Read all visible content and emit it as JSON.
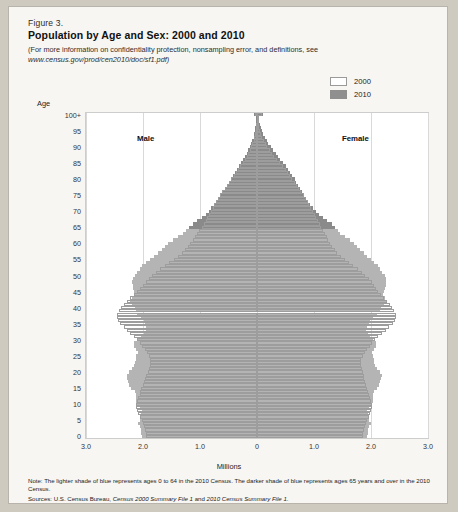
{
  "figure": {
    "number": "Figure 3.",
    "title": "Population by Age and Sex: 2000 and 2010",
    "subtitle": "(For more information on confidentiality protection, nonsampling error, and definitions, see",
    "url": "www.census.gov/prod/cen2010/doc/sf1.pdf)"
  },
  "legend": {
    "position": "top-right",
    "items": [
      {
        "label": "2000",
        "color": "#ffffff",
        "swatch": "outline"
      },
      {
        "label": "2010",
        "color": "#8f8f8f",
        "swatch": "filled"
      }
    ]
  },
  "labels": {
    "male": "Male",
    "female": "Female",
    "age_axis": "Age",
    "millions_axis": "Millions"
  },
  "footer": {
    "note": "Note: The lighter shade of blue represents ages 0 to 64 in the 2010 Census. The darker shade of blue represents ages 65 years and over in the 2010 Census.",
    "sources_prefix": "Sources: U.S. Census Bureau, ",
    "sources_italic": "Census 2000 Summary File 1",
    "sources_mid": " and ",
    "sources_italic2": "2010 Census Summary File 1",
    "sources_end": "."
  },
  "colors": {
    "bar_under65": "#b4b4b4",
    "bar_65plus": "#8a8a8a",
    "outline_2000": "#9d9d9d",
    "plot_bg": "#ffffff",
    "page_bg": "#f7f6f3",
    "gridline": "#d9d9d9"
  },
  "chart_data": {
    "type": "bar",
    "subtype": "population-pyramid",
    "title": "Population by Age and Sex: 2000 and 2010",
    "xlabel": "Millions",
    "ylabel": "Age",
    "xlim": [
      -3.0,
      3.0
    ],
    "xticks": [
      -3.0,
      -2.0,
      -1.0,
      0,
      1.0,
      2.0,
      3.0
    ],
    "xticklabels": [
      "3.0",
      "2.0",
      "1.0",
      "0",
      "1.0",
      "2.0",
      "3.0"
    ],
    "ylim": [
      0,
      100
    ],
    "yticks": [
      0,
      5,
      10,
      15,
      20,
      25,
      30,
      35,
      40,
      45,
      50,
      55,
      60,
      65,
      70,
      75,
      80,
      85,
      90,
      95,
      100
    ],
    "yticklabels": [
      "0",
      "5",
      "10",
      "15",
      "20",
      "25",
      "30",
      "35",
      "40",
      "45",
      "50",
      "55",
      "60",
      "65",
      "70",
      "75",
      "80",
      "85",
      "90",
      "95",
      "100+"
    ],
    "grid": "vertical",
    "legend_position": "top-right",
    "age_split_65": 65,
    "ages": [
      0,
      1,
      2,
      3,
      4,
      5,
      6,
      7,
      8,
      9,
      10,
      11,
      12,
      13,
      14,
      15,
      16,
      17,
      18,
      19,
      20,
      21,
      22,
      23,
      24,
      25,
      26,
      27,
      28,
      29,
      30,
      31,
      32,
      33,
      34,
      35,
      36,
      37,
      38,
      39,
      40,
      41,
      42,
      43,
      44,
      45,
      46,
      47,
      48,
      49,
      50,
      51,
      52,
      53,
      54,
      55,
      56,
      57,
      58,
      59,
      60,
      61,
      62,
      63,
      64,
      65,
      66,
      67,
      68,
      69,
      70,
      71,
      72,
      73,
      74,
      75,
      76,
      77,
      78,
      79,
      80,
      81,
      82,
      83,
      84,
      85,
      86,
      87,
      88,
      89,
      90,
      91,
      92,
      93,
      94,
      95,
      96,
      97,
      98,
      99,
      100
    ],
    "series": [
      {
        "name": "Male 2010",
        "side": "left",
        "year": 2010,
        "values": [
          2.02,
          2.03,
          2.04,
          2.06,
          2.09,
          2.06,
          2.04,
          2.03,
          2.02,
          2.05,
          2.1,
          2.12,
          2.12,
          2.12,
          2.14,
          2.21,
          2.24,
          2.26,
          2.28,
          2.28,
          2.25,
          2.19,
          2.16,
          2.14,
          2.13,
          2.12,
          2.09,
          2.12,
          2.16,
          2.15,
          2.1,
          2.03,
          1.98,
          1.95,
          1.95,
          1.97,
          1.98,
          2.03,
          2.1,
          2.13,
          2.14,
          2.2,
          2.23,
          2.2,
          2.16,
          2.16,
          2.17,
          2.18,
          2.19,
          2.18,
          2.14,
          2.1,
          2.06,
          2.01,
          1.95,
          1.88,
          1.81,
          1.74,
          1.67,
          1.62,
          1.56,
          1.48,
          1.38,
          1.29,
          1.24,
          1.19,
          1.13,
          1.05,
          0.97,
          0.9,
          0.85,
          0.8,
          0.75,
          0.71,
          0.67,
          0.63,
          0.59,
          0.55,
          0.52,
          0.49,
          0.46,
          0.42,
          0.38,
          0.35,
          0.31,
          0.28,
          0.24,
          0.21,
          0.18,
          0.15,
          0.12,
          0.1,
          0.08,
          0.06,
          0.05,
          0.04,
          0.03,
          0.02,
          0.015,
          0.01,
          0.05
        ]
      },
      {
        "name": "Female 2010",
        "side": "right",
        "year": 2010,
        "values": [
          1.93,
          1.94,
          1.95,
          1.97,
          2.0,
          1.97,
          1.95,
          1.94,
          1.93,
          1.96,
          2.01,
          2.03,
          2.03,
          2.03,
          2.05,
          2.11,
          2.14,
          2.16,
          2.18,
          2.19,
          2.16,
          2.1,
          2.07,
          2.05,
          2.05,
          2.04,
          2.02,
          2.05,
          2.09,
          2.08,
          2.04,
          1.98,
          1.94,
          1.92,
          1.93,
          1.96,
          1.98,
          2.03,
          2.11,
          2.15,
          2.17,
          2.23,
          2.27,
          2.24,
          2.21,
          2.22,
          2.24,
          2.26,
          2.27,
          2.27,
          2.24,
          2.2,
          2.16,
          2.12,
          2.06,
          2.0,
          1.93,
          1.87,
          1.81,
          1.76,
          1.71,
          1.64,
          1.55,
          1.46,
          1.42,
          1.37,
          1.31,
          1.23,
          1.15,
          1.08,
          1.03,
          0.98,
          0.93,
          0.89,
          0.86,
          0.82,
          0.79,
          0.75,
          0.72,
          0.69,
          0.66,
          0.62,
          0.58,
          0.54,
          0.5,
          0.46,
          0.41,
          0.37,
          0.33,
          0.28,
          0.24,
          0.2,
          0.17,
          0.14,
          0.11,
          0.09,
          0.07,
          0.05,
          0.035,
          0.025,
          0.11
        ]
      },
      {
        "name": "Male 2000",
        "side": "left",
        "year": 2000,
        "values": [
          1.95,
          1.95,
          1.96,
          1.98,
          2.0,
          2.02,
          2.05,
          2.08,
          2.1,
          2.12,
          2.12,
          2.1,
          2.08,
          2.06,
          2.05,
          2.03,
          2.0,
          1.98,
          1.96,
          1.94,
          1.92,
          1.9,
          1.88,
          1.87,
          1.88,
          1.9,
          1.93,
          1.97,
          2.01,
          2.05,
          2.1,
          2.16,
          2.22,
          2.28,
          2.34,
          2.4,
          2.44,
          2.46,
          2.45,
          2.42,
          2.38,
          2.33,
          2.28,
          2.22,
          2.16,
          2.1,
          2.05,
          2.0,
          1.95,
          1.9,
          1.84,
          1.78,
          1.7,
          1.62,
          1.54,
          1.46,
          1.38,
          1.32,
          1.26,
          1.21,
          1.17,
          1.13,
          1.09,
          1.05,
          1.01,
          0.97,
          0.93,
          0.9,
          0.87,
          0.84,
          0.81,
          0.78,
          0.75,
          0.72,
          0.69,
          0.65,
          0.61,
          0.57,
          0.53,
          0.49,
          0.45,
          0.41,
          0.37,
          0.33,
          0.29,
          0.25,
          0.21,
          0.18,
          0.15,
          0.12,
          0.1,
          0.08,
          0.06,
          0.045,
          0.035,
          0.025,
          0.018,
          0.012,
          0.008,
          0.005,
          0.03
        ]
      },
      {
        "name": "Female 2000",
        "side": "right",
        "year": 2000,
        "values": [
          1.86,
          1.86,
          1.87,
          1.89,
          1.91,
          1.93,
          1.96,
          1.98,
          2.0,
          2.02,
          2.02,
          2.0,
          1.98,
          1.96,
          1.95,
          1.93,
          1.91,
          1.89,
          1.88,
          1.87,
          1.86,
          1.84,
          1.83,
          1.82,
          1.83,
          1.86,
          1.89,
          1.93,
          1.98,
          2.02,
          2.07,
          2.13,
          2.19,
          2.26,
          2.32,
          2.38,
          2.42,
          2.44,
          2.44,
          2.41,
          2.37,
          2.33,
          2.28,
          2.23,
          2.18,
          2.13,
          2.09,
          2.05,
          2.01,
          1.96,
          1.9,
          1.84,
          1.77,
          1.69,
          1.61,
          1.54,
          1.47,
          1.41,
          1.36,
          1.31,
          1.28,
          1.25,
          1.22,
          1.19,
          1.16,
          1.13,
          1.1,
          1.07,
          1.04,
          1.01,
          0.98,
          0.95,
          0.92,
          0.89,
          0.86,
          0.82,
          0.78,
          0.74,
          0.7,
          0.66,
          0.62,
          0.58,
          0.54,
          0.5,
          0.45,
          0.4,
          0.35,
          0.3,
          0.26,
          0.22,
          0.18,
          0.15,
          0.12,
          0.09,
          0.07,
          0.05,
          0.038,
          0.027,
          0.018,
          0.012,
          0.08
        ]
      }
    ]
  }
}
